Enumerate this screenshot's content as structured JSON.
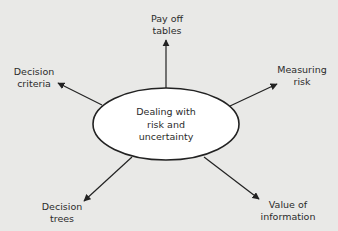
{
  "diagram": {
    "type": "mind-map",
    "center": {
      "label_lines": [
        "Dealing with",
        "risk and",
        "uncertainty"
      ]
    },
    "branches": [
      {
        "id": "payoff",
        "lines": [
          "Pay off",
          "tables"
        ],
        "direction": "up"
      },
      {
        "id": "criteria",
        "lines": [
          "Decision",
          "criteria"
        ],
        "direction": "up-left"
      },
      {
        "id": "measuring",
        "lines": [
          "Measuring",
          "risk"
        ],
        "direction": "up-right"
      },
      {
        "id": "trees",
        "lines": [
          "Decision",
          "trees"
        ],
        "direction": "down-left"
      },
      {
        "id": "value",
        "lines": [
          "Value of",
          "information"
        ],
        "direction": "down-right"
      }
    ],
    "colors": {
      "background": "#e9e9e7",
      "ellipse_fill": "#ffffff",
      "stroke": "#222222",
      "text": "#2b2b2b"
    }
  }
}
